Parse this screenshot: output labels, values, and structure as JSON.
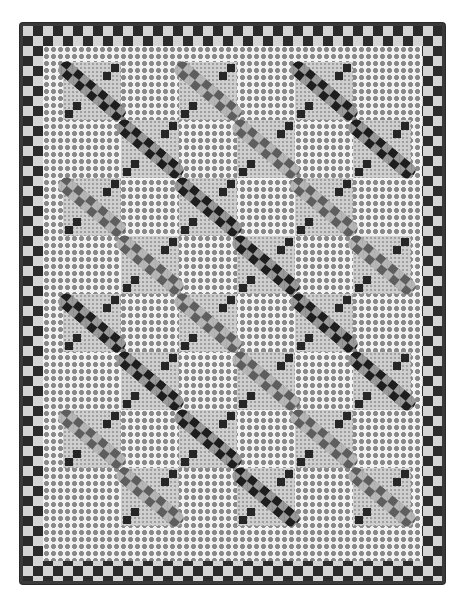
{
  "image": {
    "subject": "patchwork quilt",
    "alt": "Black-and-white photo of a patchwork quilt with diagonal checkered strip blocks alternating with polka-dot blocks, framed by a double checkerboard border"
  },
  "quilt": {
    "grid": {
      "columns": 6,
      "rows": 8,
      "block_size_px": 58
    },
    "border": {
      "type": "double checkerboard",
      "square_px": 10,
      "colors": [
        "#2b2b2b",
        "#d4d4d4"
      ]
    },
    "binding_color": "#3a3a3a",
    "field_color": "#f2f2f2",
    "dot_color": "#8a8a8a",
    "band_colors": {
      "dark": "#1e1e1e",
      "medium": "#5e5e5e"
    },
    "strip_blocks": [
      {
        "row": 0,
        "col": 0,
        "shade": "dark"
      },
      {
        "row": 0,
        "col": 2,
        "shade": "medium"
      },
      {
        "row": 0,
        "col": 4,
        "shade": "dark"
      },
      {
        "row": 1,
        "col": 1,
        "shade": "dark"
      },
      {
        "row": 1,
        "col": 3,
        "shade": "medium"
      },
      {
        "row": 1,
        "col": 5,
        "shade": "dark"
      },
      {
        "row": 2,
        "col": 0,
        "shade": "medium"
      },
      {
        "row": 2,
        "col": 2,
        "shade": "dark"
      },
      {
        "row": 2,
        "col": 4,
        "shade": "medium"
      },
      {
        "row": 3,
        "col": 1,
        "shade": "medium"
      },
      {
        "row": 3,
        "col": 3,
        "shade": "dark"
      },
      {
        "row": 3,
        "col": 5,
        "shade": "medium"
      },
      {
        "row": 4,
        "col": 0,
        "shade": "dark"
      },
      {
        "row": 4,
        "col": 2,
        "shade": "medium"
      },
      {
        "row": 4,
        "col": 4,
        "shade": "dark"
      },
      {
        "row": 5,
        "col": 1,
        "shade": "dark"
      },
      {
        "row": 5,
        "col": 3,
        "shade": "medium"
      },
      {
        "row": 5,
        "col": 5,
        "shade": "dark"
      },
      {
        "row": 6,
        "col": 0,
        "shade": "medium"
      },
      {
        "row": 6,
        "col": 2,
        "shade": "dark"
      },
      {
        "row": 6,
        "col": 4,
        "shade": "medium"
      },
      {
        "row": 7,
        "col": 1,
        "shade": "medium"
      },
      {
        "row": 7,
        "col": 3,
        "shade": "dark"
      },
      {
        "row": 7,
        "col": 5,
        "shade": "medium"
      }
    ]
  }
}
